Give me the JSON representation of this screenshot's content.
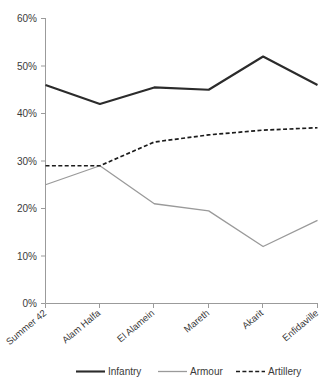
{
  "chart_data": {
    "type": "line",
    "title": "",
    "subtitle": "",
    "xlabel": "",
    "ylabel": "",
    "categories": [
      "Summer 42",
      "Alam Halfa",
      "El Alamein",
      "Mareth",
      "Akarit",
      "Enfidaville"
    ],
    "series": [
      {
        "name": "Infantry",
        "values": [
          46,
          42,
          45.5,
          45,
          52,
          46
        ],
        "color": "#2b2b2b",
        "style": "solid",
        "width": 2.1
      },
      {
        "name": "Armour",
        "values": [
          25,
          29,
          21,
          19.5,
          12,
          17.5
        ],
        "color": "#9a9a9a",
        "style": "solid",
        "width": 1.3
      },
      {
        "name": "Artillery",
        "values": [
          29,
          29,
          34,
          35.5,
          36.5,
          37
        ],
        "color": "#1c1c1c",
        "style": "dashed",
        "width": 1.7
      }
    ],
    "ylim": [
      0,
      60
    ],
    "ytick_values": [
      0,
      10,
      20,
      30,
      40,
      50,
      60
    ],
    "ytick_labels": [
      "0%",
      "10%",
      "20%",
      "30%",
      "40%",
      "50%",
      "60%"
    ],
    "grid": false,
    "legend_position": "bottom",
    "legend_entries": [
      "Infantry",
      "Armour",
      "Artillery"
    ],
    "axis_color": "#9b9b9b",
    "background": "#ffffff"
  },
  "yaxis": {
    "labels": [
      "60%",
      "50%",
      "40%",
      "30%",
      "20%",
      "10%",
      "0%"
    ]
  },
  "xaxis": {
    "labels": [
      "Summer 42",
      "Alam Halfa",
      "El Alamein",
      "Mareth",
      "Akarit",
      "Enfidaville"
    ]
  },
  "legend": {
    "items": [
      {
        "label": "Infantry"
      },
      {
        "label": "Armour"
      },
      {
        "label": "Artillery"
      }
    ]
  }
}
